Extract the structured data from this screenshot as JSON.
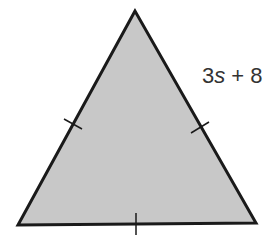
{
  "diagram": {
    "shape": "equilateral-triangle",
    "fill_color": "#c8c8c8",
    "stroke_color": "#1a1a1a",
    "side_label": {
      "coefficient": "3",
      "variable": "s",
      "rest": " + 8",
      "full": "3s + 8"
    },
    "tick_marks": 3
  }
}
